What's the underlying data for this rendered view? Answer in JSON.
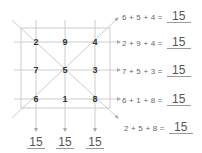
{
  "magic_square": {
    "title": "",
    "magic_constant": "15",
    "rows": [
      [
        "2",
        "9",
        "4"
      ],
      [
        "7",
        "5",
        "3"
      ],
      [
        "6",
        "1",
        "8"
      ]
    ],
    "cells": {
      "r0c0": "2",
      "r0c1": "9",
      "r0c2": "4",
      "r1c0": "7",
      "r1c1": "5",
      "r1c2": "3",
      "r2c0": "6",
      "r2c1": "1",
      "r2c2": "8"
    }
  },
  "equations": {
    "diag_up": {
      "expr": "6 + 5 + 4 =",
      "answer": "15"
    },
    "row1": {
      "expr": "2 + 9 + 4 =",
      "answer": "15"
    },
    "row2": {
      "expr": "7 + 5 + 3 =",
      "answer": "15"
    },
    "row3": {
      "expr": "6 + 1 + 8 =",
      "answer": "15"
    },
    "diag_down": {
      "expr": "2 + 5 + 8 =",
      "answer": "15"
    }
  },
  "column_sums": {
    "col1": "15",
    "col2": "15",
    "col3": "15"
  },
  "colors": {
    "line": "#c8c8c8",
    "number": "#333333",
    "equation_text": "#666666",
    "answer_text": "#555555"
  }
}
